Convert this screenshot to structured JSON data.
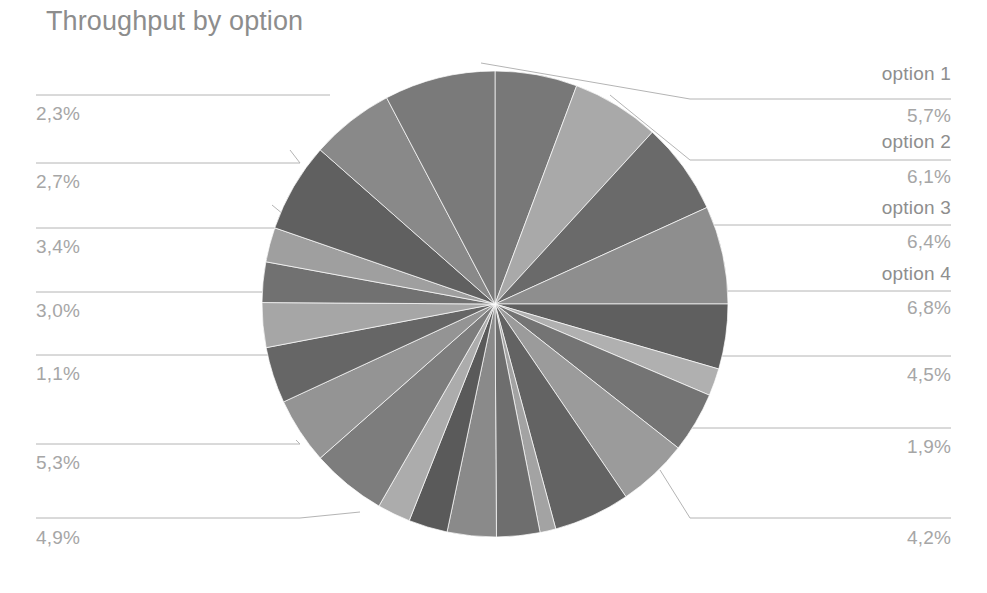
{
  "chart": {
    "title": "Throughput by option",
    "title_color": "#8d8d8d",
    "background": "#ffffff",
    "label_color": "#a6a6a6",
    "name_color": "#8e8e8e",
    "leader_line_color": "#b4b4b4"
  },
  "chart_data": {
    "type": "pie",
    "title": "Throughput by option",
    "xlabel": "",
    "ylabel": "",
    "grid": false,
    "legend": "none",
    "value_suffix": "%",
    "decimal_separator": ",",
    "labels_outside": true,
    "center": {
      "x": 495,
      "y": 304,
      "r": 233
    },
    "categories": [
      "option 1",
      "option 2",
      "option 3",
      "option 4",
      "",
      "",
      "",
      "",
      "",
      "",
      "",
      "",
      "",
      "",
      "",
      "",
      "",
      "",
      "",
      "",
      "",
      "",
      ""
    ],
    "labeled_slices": [
      {
        "name": "option 1",
        "value": 5.7,
        "display": "5,7%",
        "side": "right"
      },
      {
        "name": "option 2",
        "value": 6.1,
        "display": "6,1%",
        "side": "right"
      },
      {
        "name": "option 3",
        "value": 6.4,
        "display": "6,4%",
        "side": "right"
      },
      {
        "name": "option 4",
        "value": 6.8,
        "display": "6,8%",
        "side": "right"
      },
      {
        "name": "",
        "value": 4.5,
        "display": "4,5%",
        "side": "right"
      },
      {
        "name": "",
        "value": 1.9,
        "display": "1,9%",
        "side": "right"
      },
      {
        "name": "",
        "value": 4.2,
        "display": "4,2%",
        "side": "right"
      },
      {
        "name": "",
        "value": 4.9,
        "display": "4,9%",
        "side": "left"
      },
      {
        "name": "",
        "value": 5.3,
        "display": "5,3%",
        "side": "left"
      },
      {
        "name": "",
        "value": 1.1,
        "display": "1,1%",
        "side": "left"
      },
      {
        "name": "",
        "value": 3.0,
        "display": "3,0%",
        "side": "left"
      },
      {
        "name": "",
        "value": 3.4,
        "display": "3,4%",
        "side": "left"
      },
      {
        "name": "",
        "value": 2.7,
        "display": "2,7%",
        "side": "left"
      },
      {
        "name": "",
        "value": 2.3,
        "display": "2,3%",
        "side": "left"
      }
    ],
    "values": [
      5.7,
      6.1,
      6.4,
      6.8,
      4.5,
      1.9,
      4.2,
      4.9,
      5.3,
      1.1,
      3.0,
      3.4,
      2.7,
      2.3,
      5.2,
      4.6,
      3.9,
      3.1,
      2.8,
      2.4,
      6.2,
      5.8,
      7.7
    ],
    "colors": [
      "#787878",
      "#a9a9a9",
      "#6a6a6a",
      "#8e8e8e",
      "#5f5f5f",
      "#b0b0b0",
      "#747474",
      "#9b9b9b",
      "#636363",
      "#a3a3a3",
      "#6e6e6e",
      "#8a8a8a",
      "#5a5a5a",
      "#acacac",
      "#7d7d7d",
      "#949494",
      "#666666",
      "#a6a6a6",
      "#717171",
      "#9f9f9f",
      "#606060",
      "#898989",
      "#7a7a7a"
    ]
  },
  "callouts": {
    "right": [
      {
        "name": "option 1",
        "pct": "5,7%"
      },
      {
        "name": "option 2",
        "pct": "6,1%"
      },
      {
        "name": "option 3",
        "pct": "6,4%"
      },
      {
        "name": "option 4",
        "pct": "6,8%"
      },
      {
        "name": "",
        "pct": "4,5%"
      },
      {
        "name": "",
        "pct": "1,9%"
      },
      {
        "name": "",
        "pct": "4,2%"
      }
    ],
    "left": [
      {
        "name": "",
        "pct": "2,3%"
      },
      {
        "name": "",
        "pct": "2,7%"
      },
      {
        "name": "",
        "pct": "3,4%"
      },
      {
        "name": "",
        "pct": "3,0%"
      },
      {
        "name": "",
        "pct": "1,1%"
      },
      {
        "name": "",
        "pct": "5,3%"
      },
      {
        "name": "",
        "pct": "4,9%"
      }
    ]
  }
}
